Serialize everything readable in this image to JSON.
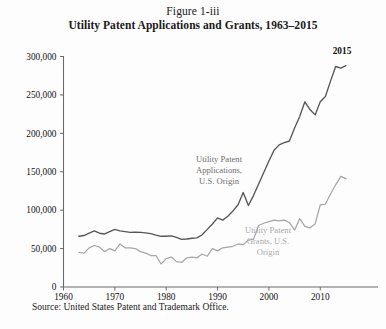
{
  "figure": {
    "number": "Figure 1-iii",
    "title": "Utility Patent Applications and Grants, 1963–2015",
    "source": "Source: United States Patent and Trademark Office."
  },
  "colors": {
    "applications_line": "#56565a",
    "grants_line": "#a6a6a6",
    "axis": "#6b6b6b",
    "background": "#fdfdfd",
    "text": "#111111"
  },
  "annotations": {
    "applications": "Utility Patent Applications, U.S. Origin",
    "applications_lines": [
      "Utility Patent",
      "Applications,",
      "U.S. Origin"
    ],
    "grants": "Utility Patent Grants, U.S. Origin",
    "grants_lines": [
      "Utility Patent",
      "Grants, U.S.",
      "Origin"
    ],
    "endpoint": "2015"
  },
  "chart_data": {
    "type": "line",
    "title": "Utility Patent Applications and Grants, 1963–2015",
    "subtitle": "Figure 1-iii",
    "xlabel": "",
    "ylabel": "",
    "xlim": [
      1960,
      2017
    ],
    "ylim": [
      0,
      300000
    ],
    "xticks": [
      1960,
      1970,
      1980,
      1990,
      2000,
      2010
    ],
    "xtick_labels": [
      "1960",
      "1970",
      "1980",
      "1990",
      "2000",
      "2010"
    ],
    "yticks": [
      0,
      50000,
      100000,
      150000,
      200000,
      250000,
      300000
    ],
    "ytick_labels": [
      "0",
      "50,000",
      "100,000",
      "150,000",
      "200,000",
      "250,000",
      "300,000"
    ],
    "grid": false,
    "legend": "inline annotations",
    "x": [
      1963,
      1964,
      1965,
      1966,
      1967,
      1968,
      1969,
      1970,
      1971,
      1972,
      1973,
      1974,
      1975,
      1976,
      1977,
      1978,
      1979,
      1980,
      1981,
      1982,
      1983,
      1984,
      1985,
      1986,
      1987,
      1988,
      1989,
      1990,
      1991,
      1992,
      1993,
      1994,
      1995,
      1996,
      1997,
      1998,
      1999,
      2000,
      2001,
      2002,
      2003,
      2004,
      2005,
      2006,
      2007,
      2008,
      2009,
      2010,
      2011,
      2012,
      2013,
      2014,
      2015
    ],
    "series": [
      {
        "name": "Utility Patent Applications, U.S. Origin",
        "color": "#56565a",
        "values": [
          66000,
          67000,
          70000,
          73000,
          70000,
          69000,
          72000,
          75000,
          73000,
          72000,
          71000,
          71500,
          71000,
          70500,
          69500,
          67500,
          66000,
          66000,
          66500,
          64500,
          62000,
          62500,
          63500,
          64000,
          68000,
          75000,
          82000,
          90000,
          87000,
          92000,
          99000,
          107000,
          123000,
          106000,
          119000,
          134000,
          149000,
          164000,
          178000,
          185000,
          188000,
          190000,
          207000,
          222000,
          241000,
          231000,
          224000,
          241000,
          248000,
          268000,
          287000,
          285000,
          288000
        ]
      },
      {
        "name": "Utility Patent Grants, U.S. Origin",
        "color": "#a6a6a6",
        "values": [
          45000,
          44000,
          51000,
          54000,
          52000,
          46000,
          50000,
          47000,
          56000,
          51000,
          51000,
          50000,
          46000,
          44000,
          41000,
          41000,
          30000,
          37000,
          39000,
          33000,
          32000,
          38000,
          39000,
          38000,
          43000,
          40000,
          50000,
          47000,
          51000,
          52000,
          53000,
          56000,
          55000,
          61000,
          62000,
          80000,
          83000,
          85000,
          87000,
          86000,
          87000,
          84000,
          74000,
          89000,
          79000,
          77000,
          82000,
          107000,
          108000,
          121000,
          133000,
          144000,
          141000
        ]
      }
    ]
  }
}
